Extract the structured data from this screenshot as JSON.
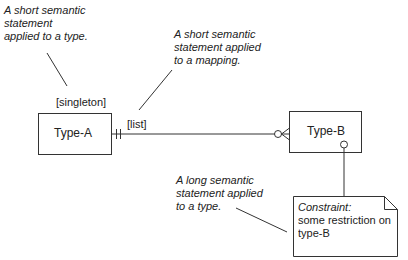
{
  "annotations": {
    "type_statement": [
      "A short semantic",
      "statement",
      "applied to a type."
    ],
    "mapping_statement": [
      "A short semantic",
      "statement applied",
      "to a mapping."
    ],
    "long_type_statement": [
      "A long semantic",
      "statement applied",
      "to a type."
    ]
  },
  "entities": {
    "type_a": {
      "name": "Type-A",
      "stereotype": "[singleton]"
    },
    "type_b": {
      "name": "Type-B"
    }
  },
  "relationship": {
    "label": "[list]",
    "source_cardinality": "exactly-one",
    "target_cardinality": "zero-or-many"
  },
  "constraint_note": {
    "title": "Constraint:",
    "lines": [
      "some restriction on",
      "type-B"
    ]
  }
}
